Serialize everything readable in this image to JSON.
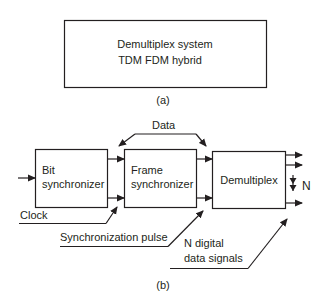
{
  "panel_a": {
    "box_line1": "Demultiplex system",
    "box_line2": "TDM FDM hybrid",
    "caption": "(a)"
  },
  "panel_b": {
    "blocks": {
      "bit_sync": {
        "line1": "Bit",
        "line2": "synchronizer"
      },
      "frame_sync": {
        "line1": "Frame",
        "line2": "synchronizer"
      },
      "demux": {
        "line1": "Demultiplex"
      }
    },
    "labels": {
      "data": "Data",
      "clock": "Clock",
      "sync_pulse": "Synchronization pulse",
      "n_digital_line1": "N digital",
      "n_digital_line2": "data signals",
      "n": "N"
    },
    "caption": "(b)"
  },
  "colors": {
    "stroke": "#231f20",
    "background": "#ffffff"
  }
}
